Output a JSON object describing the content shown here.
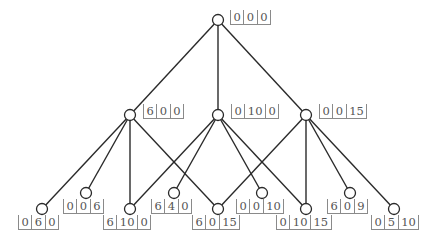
{
  "diagram": {
    "type": "lattice",
    "nodes": [
      {
        "id": "n000",
        "x": 218,
        "y": 20,
        "values": [
          "0",
          "0",
          "0"
        ],
        "label_x": 230,
        "label_y": 10
      },
      {
        "id": "n600",
        "x": 130,
        "y": 115,
        "values": [
          "6",
          "0",
          "0"
        ],
        "label_x": 143,
        "label_y": 104
      },
      {
        "id": "n0100",
        "x": 218,
        "y": 115,
        "values": [
          "0",
          "10",
          "0"
        ],
        "label_x": 231,
        "label_y": 104
      },
      {
        "id": "n0015",
        "x": 306,
        "y": 115,
        "values": [
          "0",
          "0",
          "15"
        ],
        "label_x": 319,
        "label_y": 104
      },
      {
        "id": "n060",
        "x": 42,
        "y": 209,
        "values": [
          "0",
          "6",
          "0"
        ],
        "label_x": 18,
        "label_y": 215
      },
      {
        "id": "n006",
        "x": 86,
        "y": 193,
        "values": [
          "0",
          "0",
          "6"
        ],
        "label_x": 63,
        "label_y": 199
      },
      {
        "id": "n6100",
        "x": 130,
        "y": 209,
        "values": [
          "6",
          "10",
          "0"
        ],
        "label_x": 103,
        "label_y": 215
      },
      {
        "id": "n640",
        "x": 174,
        "y": 193,
        "values": [
          "6",
          "4",
          "0"
        ],
        "label_x": 151,
        "label_y": 199
      },
      {
        "id": "n6015",
        "x": 218,
        "y": 209,
        "values": [
          "6",
          "0",
          "15"
        ],
        "label_x": 192,
        "label_y": 215
      },
      {
        "id": "n0010",
        "x": 262,
        "y": 193,
        "values": [
          "0",
          "0",
          "10"
        ],
        "label_x": 236,
        "label_y": 199
      },
      {
        "id": "n01015",
        "x": 306,
        "y": 209,
        "values": [
          "0",
          "10",
          "15"
        ],
        "label_x": 276,
        "label_y": 215
      },
      {
        "id": "n609",
        "x": 350,
        "y": 193,
        "values": [
          "6",
          "0",
          "9"
        ],
        "label_x": 327,
        "label_y": 199
      },
      {
        "id": "n0510",
        "x": 394,
        "y": 209,
        "values": [
          "0",
          "5",
          "10"
        ],
        "label_x": 371,
        "label_y": 215
      }
    ],
    "edges": [
      [
        "n000",
        "n600"
      ],
      [
        "n000",
        "n0100"
      ],
      [
        "n000",
        "n0015"
      ],
      [
        "n600",
        "n060"
      ],
      [
        "n600",
        "n006"
      ],
      [
        "n600",
        "n6100"
      ],
      [
        "n600",
        "n6015"
      ],
      [
        "n0100",
        "n6100"
      ],
      [
        "n0100",
        "n640"
      ],
      [
        "n0100",
        "n0010"
      ],
      [
        "n0100",
        "n01015"
      ],
      [
        "n0015",
        "n6015"
      ],
      [
        "n0015",
        "n01015"
      ],
      [
        "n0015",
        "n609"
      ],
      [
        "n0015",
        "n0510"
      ]
    ],
    "node_radius": 5.5,
    "colors": {
      "line": "#2a2a2a",
      "label_text": "#555555",
      "label_rule": "#8a8a8a",
      "background": "#ffffff"
    }
  }
}
